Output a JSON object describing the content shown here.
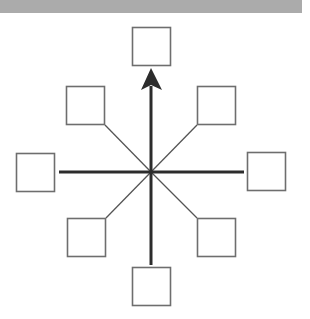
{
  "diagram": {
    "type": "radial-star",
    "center": {
      "x": 151,
      "y": 172
    },
    "colors": {
      "band": "#ababab",
      "box_stroke": "#6e6e6e",
      "axis": "#2c2c2c",
      "diagonal": "#555555",
      "background": "#ffffff"
    },
    "nodes": [
      {
        "id": "top",
        "label": "",
        "x": 132,
        "y": 27,
        "w": 39,
        "h": 39
      },
      {
        "id": "top-left",
        "label": "",
        "x": 66,
        "y": 86,
        "w": 39,
        "h": 39
      },
      {
        "id": "top-right",
        "label": "",
        "x": 197,
        "y": 86,
        "w": 39,
        "h": 39
      },
      {
        "id": "left",
        "label": "",
        "x": 16,
        "y": 153,
        "w": 39,
        "h": 39
      },
      {
        "id": "right",
        "label": "",
        "x": 247,
        "y": 152,
        "w": 39,
        "h": 39
      },
      {
        "id": "bottom-left",
        "label": "",
        "x": 67,
        "y": 218,
        "w": 39,
        "h": 39
      },
      {
        "id": "bottom-right",
        "label": "",
        "x": 197,
        "y": 218,
        "w": 39,
        "h": 39
      },
      {
        "id": "bottom",
        "label": "",
        "x": 132,
        "y": 267,
        "w": 39,
        "h": 39
      }
    ],
    "edges": [
      {
        "from": "bottom",
        "to": "top",
        "style": "thick",
        "arrow": "end",
        "direction": "up"
      },
      {
        "from": "left",
        "to": "right",
        "style": "thick",
        "arrow": "none"
      },
      {
        "from": "top-left",
        "to": "center",
        "style": "thin",
        "arrow": "none"
      },
      {
        "from": "top-right",
        "to": "center",
        "style": "thin",
        "arrow": "none"
      },
      {
        "from": "bottom-left",
        "to": "center",
        "style": "thin",
        "arrow": "none"
      },
      {
        "from": "bottom-right",
        "to": "center",
        "style": "thin",
        "arrow": "none"
      }
    ]
  }
}
